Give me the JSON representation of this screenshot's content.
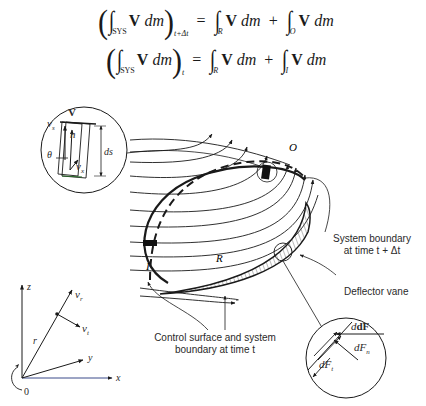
{
  "equations": {
    "line1": {
      "lhs_integrand": "V",
      "lhs_differential": "dm",
      "lhs_limit": "SYS",
      "lhs_time": "t+Δt",
      "equals": "=",
      "term1_limit": "R",
      "term1_integrand": "V",
      "term1_differential": "dm",
      "plus": "+",
      "term2_limit": "O",
      "term2_integrand": "V",
      "term2_differential": "dm"
    },
    "line2": {
      "lhs_integrand": "V",
      "lhs_differential": "dm",
      "lhs_limit": "SYS",
      "lhs_time": "t",
      "equals": "=",
      "term1_limit": "R",
      "term1_integrand": "V",
      "term1_differential": "dm",
      "plus": "+",
      "term2_limit": "I",
      "term2_integrand": "V",
      "term2_differential": "dm"
    }
  },
  "inset_element": {
    "V": "V",
    "vs": "v",
    "vs_sub": "s",
    "n": "n",
    "theta": "θ",
    "vx": "v",
    "vx_sub": "x",
    "ds": "ds"
  },
  "main_figure": {
    "region_R": "R",
    "region_O": "O",
    "region_I": "I",
    "label_system_boundary_line1": "System boundary",
    "label_system_boundary_line2": "at time t + Δt",
    "label_deflector": "Deflector vane",
    "label_control_surface_line1": "Control surface and system",
    "label_control_surface_line2": "boundary at time t"
  },
  "force_inset": {
    "dF": "dF",
    "dFn": "dF",
    "dFn_sub": "n",
    "dFt": "dF",
    "dFt_sub": "t"
  },
  "axes": {
    "z": "z",
    "x": "x",
    "y": "y",
    "r": "r",
    "vr": "v",
    "vr_sub": "r",
    "vt": "v",
    "vt_sub": "t",
    "origin": "0"
  }
}
